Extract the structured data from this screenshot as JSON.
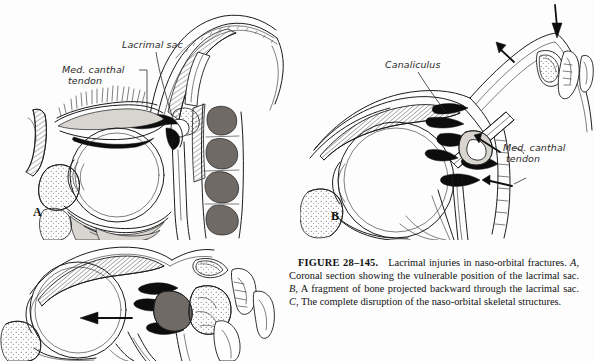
{
  "figure": {
    "number_label": "FIGURE 28–145.",
    "title": "Lacrimal injuries in naso-orbital fractures.",
    "panel_a_letter": "A",
    "panel_b_letter": "B",
    "panel_c_letter": "C",
    "caption_part_a": ", Coronal section showing the vulnerable position of the lacrimal sac.",
    "caption_part_b": ", A fragment of bone projected backward through the lacrimal sac.",
    "caption_part_c": ", The complete disruption of the naso-orbital skeletal structures."
  },
  "panels": {
    "a": {
      "letter": "A",
      "labels": [
        {
          "text": "Lacrimal sac",
          "name": "label-lacrimal-sac"
        },
        {
          "text_line1": "Med. canthal",
          "text_line2": "tendon",
          "name": "label-med-canthal-tendon"
        }
      ]
    },
    "b": {
      "letter": "B",
      "labels": [
        {
          "text": "Canaliculus",
          "name": "label-canaliculus"
        },
        {
          "text_line1": "Med. canthal",
          "text_line2": "tendon",
          "name": "label-med-canthal-tendon"
        }
      ]
    },
    "c": {
      "letter": "C",
      "labels": []
    }
  },
  "colors": {
    "page_background": "#fdfdfd",
    "ink": "#1b1b1b",
    "dark_fill": "#0d0d0d",
    "mid_fill": "#6f6a66",
    "light_fill": "#d8d5d1"
  }
}
